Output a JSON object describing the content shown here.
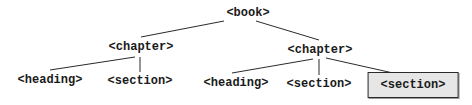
{
  "diagram": {
    "type": "tree",
    "root": {
      "label": "<book>",
      "children": [
        {
          "label": "<chapter>",
          "children": [
            {
              "label": "<heading>"
            },
            {
              "label": "<section>"
            }
          ]
        },
        {
          "label": "<chapter>",
          "children": [
            {
              "label": "<heading>"
            },
            {
              "label": "<section>"
            },
            {
              "label": "<section>",
              "highlighted": true
            }
          ]
        }
      ]
    },
    "highlight_fill": "#e6e6e6",
    "line_color": "#2a2a2a"
  }
}
